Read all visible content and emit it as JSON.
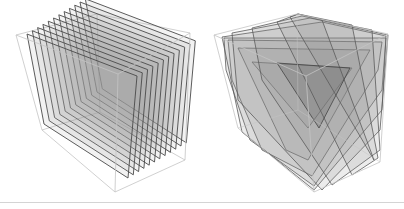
{
  "figure": {
    "panels": [
      {
        "id": "left",
        "description": "Unit cube sliced by planes parallel to a face",
        "slice_count": 12,
        "slice_orientation": "axis-aligned",
        "outline_color": "#bdbdbd",
        "slice_edge_color": "#4a4a4a",
        "slice_fill_color": "#9a9a9a"
      },
      {
        "id": "right",
        "description": "Unit cube sliced by planes perpendicular to the body diagonal",
        "slice_count": 9,
        "slice_orientation": "diagonal",
        "outline_color": "#bdbdbd",
        "slice_edge_color": "#5a5a5a",
        "slice_fill_color": "#8a8a8a"
      }
    ],
    "divider_color": "#d4d4d4"
  }
}
